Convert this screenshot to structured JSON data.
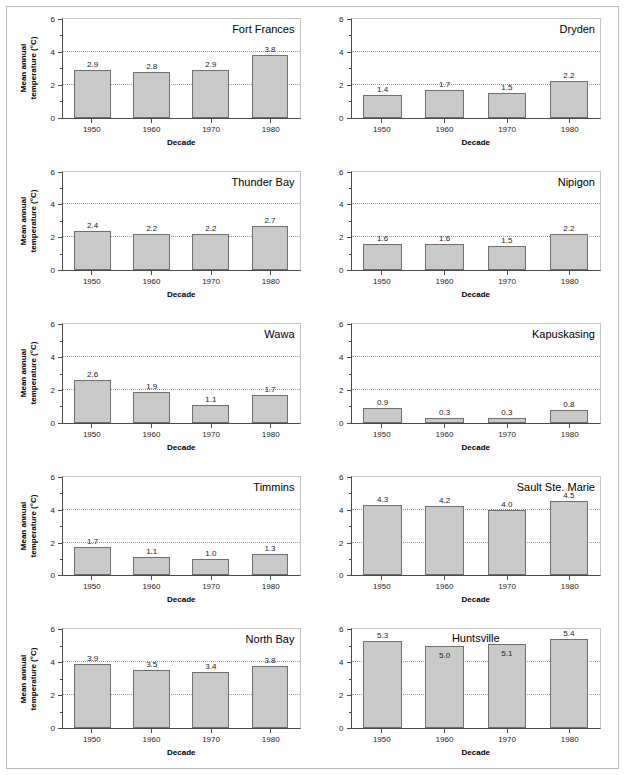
{
  "figure": {
    "y_axis_title_line1": "Mean annual",
    "y_axis_title_line2": "temperature (°C)",
    "x_axis_title": "Decade",
    "y_tick_labels": [
      "0",
      "2",
      "4",
      "6"
    ],
    "x_tick_labels": [
      "1950",
      "1960",
      "1970",
      "1980"
    ],
    "bar_fill_color": "#c9c9c9",
    "bar_edge_color": "#6f6f6f",
    "gridline_color": "#9a9a9a",
    "axis_color": "#4a4a4a"
  },
  "chart_data": [
    {
      "type": "bar",
      "title": "Fort Frances",
      "xlabel": "Decade",
      "ylabel": "Mean annual temperature (°C)",
      "categories": [
        "1950",
        "1960",
        "1970",
        "1980"
      ],
      "values": [
        2.9,
        2.8,
        2.9,
        3.8
      ],
      "labels": [
        "2.9",
        "2.8",
        "2.9",
        "3.8"
      ],
      "ylim": [
        0,
        6
      ],
      "yticks": [
        0,
        2,
        4,
        6
      ],
      "gridlines": [
        2,
        4
      ],
      "grid": true,
      "legend": "none",
      "title_position": "top-right",
      "show_ylabel": true
    },
    {
      "type": "bar",
      "title": "Dryden",
      "xlabel": "Decade",
      "ylabel": "",
      "categories": [
        "1950",
        "1960",
        "1970",
        "1980"
      ],
      "values": [
        1.4,
        1.7,
        1.5,
        2.2
      ],
      "labels": [
        "1.4",
        "1.7",
        "1.5",
        "2.2"
      ],
      "ylim": [
        0,
        6
      ],
      "yticks": [
        0,
        2,
        4,
        6
      ],
      "gridlines": [
        2,
        4
      ],
      "grid": true,
      "legend": "none",
      "title_position": "top-right",
      "show_ylabel": false
    },
    {
      "type": "bar",
      "title": "Thunder Bay",
      "xlabel": "Decade",
      "ylabel": "Mean annual temperature (°C)",
      "categories": [
        "1950",
        "1960",
        "1970",
        "1980"
      ],
      "values": [
        2.4,
        2.2,
        2.2,
        2.7
      ],
      "labels": [
        "2.4",
        "2.2",
        "2.2",
        "2.7"
      ],
      "ylim": [
        0,
        6
      ],
      "yticks": [
        0,
        2,
        4,
        6
      ],
      "gridlines": [
        2,
        4
      ],
      "grid": true,
      "legend": "none",
      "title_position": "top-right",
      "show_ylabel": true
    },
    {
      "type": "bar",
      "title": "Nipigon",
      "xlabel": "Decade",
      "ylabel": "",
      "categories": [
        "1950",
        "1960",
        "1970",
        "1980"
      ],
      "values": [
        1.6,
        1.6,
        1.5,
        2.2
      ],
      "labels": [
        "1.6",
        "1.6",
        "1.5",
        "2.2"
      ],
      "ylim": [
        0,
        6
      ],
      "yticks": [
        0,
        2,
        4,
        6
      ],
      "gridlines": [
        2,
        4
      ],
      "grid": true,
      "legend": "none",
      "title_position": "top-right",
      "show_ylabel": false
    },
    {
      "type": "bar",
      "title": "Wawa",
      "xlabel": "Decade",
      "ylabel": "Mean annual temperature (°C)",
      "categories": [
        "1950",
        "1960",
        "1970",
        "1980"
      ],
      "values": [
        2.6,
        1.9,
        1.1,
        1.7
      ],
      "labels": [
        "2.6",
        "1.9",
        "1.1",
        "1.7"
      ],
      "ylim": [
        0,
        6
      ],
      "yticks": [
        0,
        2,
        4,
        6
      ],
      "gridlines": [
        2,
        4
      ],
      "grid": true,
      "legend": "none",
      "title_position": "top-right",
      "show_ylabel": true
    },
    {
      "type": "bar",
      "title": "Kapuskasing",
      "xlabel": "Decade",
      "ylabel": "",
      "categories": [
        "1950",
        "1960",
        "1970",
        "1980"
      ],
      "values": [
        0.9,
        0.3,
        0.3,
        0.8
      ],
      "labels": [
        "0.9",
        "0.3",
        "0.3",
        "0.8"
      ],
      "ylim": [
        0,
        6
      ],
      "yticks": [
        0,
        2,
        4,
        6
      ],
      "gridlines": [
        2,
        4
      ],
      "grid": true,
      "legend": "none",
      "title_position": "top-right",
      "show_ylabel": false
    },
    {
      "type": "bar",
      "title": "Timmins",
      "xlabel": "Decade",
      "ylabel": "Mean annual temperature (°C)",
      "categories": [
        "1950",
        "1960",
        "1970",
        "1980"
      ],
      "values": [
        1.7,
        1.1,
        1.0,
        1.3
      ],
      "labels": [
        "1.7",
        "1.1",
        "1.0",
        "1.3"
      ],
      "ylim": [
        0,
        6
      ],
      "yticks": [
        0,
        2,
        4,
        6
      ],
      "gridlines": [
        2,
        4
      ],
      "grid": true,
      "legend": "none",
      "title_position": "top-right",
      "show_ylabel": true
    },
    {
      "type": "bar",
      "title": "Sault Ste. Marie",
      "xlabel": "Decade",
      "ylabel": "",
      "categories": [
        "1950",
        "1960",
        "1970",
        "1980"
      ],
      "values": [
        4.3,
        4.2,
        4.0,
        4.5
      ],
      "labels": [
        "4.3",
        "4.2",
        "4.0",
        "4.5"
      ],
      "ylim": [
        0,
        6
      ],
      "yticks": [
        0,
        2,
        4,
        6
      ],
      "gridlines": [
        2,
        4
      ],
      "grid": true,
      "legend": "none",
      "title_position": "top-right",
      "show_ylabel": false
    },
    {
      "type": "bar",
      "title": "North Bay",
      "xlabel": "Decade",
      "ylabel": "Mean annual temperature (°C)",
      "categories": [
        "1950",
        "1960",
        "1970",
        "1980"
      ],
      "values": [
        3.9,
        3.5,
        3.4,
        3.8
      ],
      "labels": [
        "3.9",
        "3.5",
        "3.4",
        "3.8"
      ],
      "ylim": [
        0,
        6
      ],
      "yticks": [
        0,
        2,
        4,
        6
      ],
      "gridlines": [
        2,
        4
      ],
      "grid": true,
      "legend": "none",
      "title_position": "top-right",
      "show_ylabel": true
    },
    {
      "type": "bar",
      "title": "Huntsville",
      "xlabel": "Decade",
      "ylabel": "",
      "categories": [
        "1950",
        "1960",
        "1970",
        "1980"
      ],
      "values": [
        5.3,
        5.0,
        5.1,
        5.4
      ],
      "labels": [
        "5.3",
        "5.0",
        "5.1",
        "5.4"
      ],
      "label_inside": [
        false,
        true,
        true,
        false
      ],
      "ylim": [
        0,
        6
      ],
      "yticks": [
        0,
        2,
        4,
        6
      ],
      "gridlines": [
        2,
        4
      ],
      "grid": true,
      "legend": "none",
      "title_position": "top-center",
      "show_ylabel": false
    }
  ]
}
